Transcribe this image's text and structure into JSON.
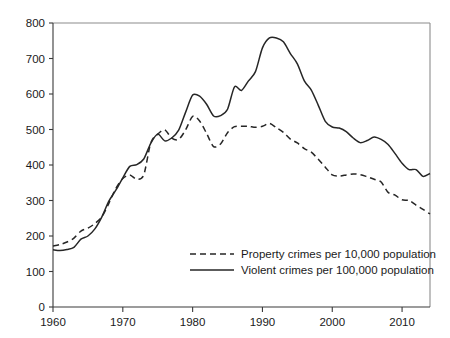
{
  "chart_data": {
    "type": "line",
    "title": "",
    "subtitle": "",
    "xlabel": "",
    "ylabel": "",
    "xlim": [
      1960,
      2014
    ],
    "ylim": [
      0,
      800
    ],
    "grid": false,
    "legend_position": "inside-bottom-right",
    "x_ticks": [
      "1960",
      "1970",
      "1980",
      "1990",
      "2000",
      "2010"
    ],
    "x_tick_values": [
      1960,
      1970,
      1980,
      1990,
      2000,
      2010
    ],
    "y_ticks": [
      "0",
      "100",
      "200",
      "300",
      "400",
      "500",
      "600",
      "700",
      "800"
    ],
    "y_tick_values": [
      0,
      100,
      200,
      300,
      400,
      500,
      600,
      700,
      800
    ],
    "x": [
      1960,
      1961,
      1962,
      1963,
      1964,
      1965,
      1966,
      1967,
      1968,
      1969,
      1970,
      1971,
      1972,
      1973,
      1974,
      1975,
      1976,
      1977,
      1978,
      1979,
      1980,
      1981,
      1982,
      1983,
      1984,
      1985,
      1986,
      1987,
      1988,
      1989,
      1990,
      1991,
      1992,
      1993,
      1994,
      1995,
      1996,
      1997,
      1998,
      1999,
      2000,
      2001,
      2002,
      2003,
      2004,
      2005,
      2006,
      2007,
      2008,
      2009,
      2010,
      2011,
      2012,
      2013,
      2014
    ],
    "series": [
      {
        "name": "Property crimes per 10,000 population",
        "style": "dashed",
        "color": "#262626",
        "values": [
          172,
          176,
          183,
          194,
          214,
          222,
          235,
          254,
          292,
          334,
          362,
          372,
          360,
          372,
          462,
          487,
          499,
          476,
          472,
          499,
          537,
          524,
          489,
          452,
          459,
          491,
          508,
          509,
          509,
          506,
          509,
          517,
          505,
          492,
          473,
          462,
          446,
          436,
          416,
          394,
          372,
          369,
          372,
          375,
          373,
          367,
          360,
          352,
          323,
          315,
          302,
          300,
          287,
          275,
          262
        ]
      },
      {
        "name": "Violent crimes per 100,000 population",
        "style": "solid",
        "color": "#262626",
        "values": [
          161,
          159,
          162,
          168,
          191,
          200,
          220,
          254,
          298,
          329,
          364,
          396,
          401,
          417,
          461,
          487,
          468,
          476,
          498,
          549,
          597,
          594,
          571,
          538,
          539,
          557,
          620,
          610,
          637,
          663,
          730,
          758,
          758,
          747,
          714,
          685,
          637,
          611,
          568,
          523,
          507,
          504,
          494,
          476,
          463,
          469,
          479,
          472,
          458,
          432,
          405,
          387,
          387,
          368,
          376
        ]
      }
    ]
  },
  "axes": {
    "y_axis_name": "y-axis",
    "x_axis_name": "x-axis"
  },
  "legend": {
    "entries": [
      {
        "label": "Property crimes per 10,000 population",
        "marker": "dashed-line"
      },
      {
        "label": "Violent crimes per 100,000 population",
        "marker": "solid-line"
      }
    ]
  }
}
